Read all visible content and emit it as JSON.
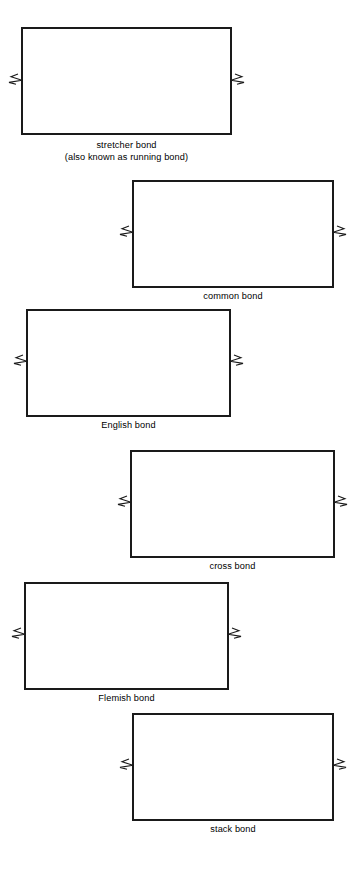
{
  "page": {
    "background_color": "#ffffff",
    "line_color": "#1a1a1a",
    "brick_fill": "#ffffff",
    "width": 357,
    "height": 869
  },
  "figures": [
    {
      "id": "stretcher-bond",
      "caption_lines": [
        "stretcher bond",
        "(also known as running bond)"
      ],
      "caption_text": "stretcher bond (also known as running bond)",
      "align": "left",
      "wall": {
        "x": 22,
        "y": 28,
        "width": 209,
        "height": 106
      },
      "caption": {
        "y": 139
      },
      "courses": 7,
      "course_height": 15.14,
      "pattern": "running",
      "break_symbols": [
        "left",
        "right"
      ],
      "break_y": 79,
      "rows": [
        {
          "type": "stretcher",
          "offset": 0.0
        },
        {
          "type": "stretcher",
          "offset": 0.5
        },
        {
          "type": "stretcher",
          "offset": 0.0
        },
        {
          "type": "stretcher",
          "offset": 0.5
        },
        {
          "type": "stretcher",
          "offset": 0.0
        },
        {
          "type": "stretcher",
          "offset": 0.5
        },
        {
          "type": "stretcher",
          "offset": 0.0
        }
      ],
      "unit_width": 37.0
    },
    {
      "id": "common-bond",
      "caption_lines": [
        "common bond"
      ],
      "caption_text": "common bond",
      "align": "right",
      "wall": {
        "x": 133,
        "y": 181,
        "width": 200,
        "height": 106
      },
      "caption": {
        "y": 290
      },
      "courses": 7,
      "course_height": 15.14,
      "pattern": "common",
      "break_symbols": [
        "left",
        "right"
      ],
      "break_y": 231,
      "rows": [
        {
          "type": "header",
          "offset": 0.0
        },
        {
          "type": "stretcher",
          "offset": 0.25
        },
        {
          "type": "stretcher",
          "offset": 0.0
        },
        {
          "type": "stretcher",
          "offset": 0.5
        },
        {
          "type": "stretcher",
          "offset": 0.0
        },
        {
          "type": "stretcher",
          "offset": 0.5
        },
        {
          "type": "header",
          "offset": 0.0
        }
      ],
      "unit_width": 35.5,
      "header_width": 15.2
    },
    {
      "id": "english-bond",
      "caption_lines": [
        "English bond"
      ],
      "caption_text": "English bond",
      "align": "left",
      "wall": {
        "x": 27,
        "y": 310,
        "width": 203,
        "height": 106
      },
      "caption": {
        "y": 419
      },
      "courses": 7,
      "course_height": 15.14,
      "pattern": "english",
      "break_symbols": [
        "left",
        "right"
      ],
      "break_y": 360,
      "rows": [
        {
          "type": "stretcher",
          "offset": 0.0
        },
        {
          "type": "header",
          "offset": 0.25
        },
        {
          "type": "stretcher",
          "offset": 0.5
        },
        {
          "type": "header",
          "offset": 0.75
        },
        {
          "type": "stretcher",
          "offset": 0.0
        },
        {
          "type": "header",
          "offset": 0.25
        },
        {
          "type": "stretcher",
          "offset": 0.5
        }
      ],
      "unit_width": 37.2,
      "header_width": 18.6
    },
    {
      "id": "cross-bond",
      "caption_lines": [
        "cross bond"
      ],
      "caption_text": "cross bond",
      "align": "right",
      "wall": {
        "x": 131,
        "y": 451,
        "width": 203,
        "height": 106
      },
      "caption": {
        "y": 560
      },
      "courses": 7,
      "course_height": 15.14,
      "pattern": "cross",
      "break_symbols": [
        "left",
        "right"
      ],
      "break_y": 501,
      "rows": [
        {
          "type": "stretcher",
          "offset": 0.0
        },
        {
          "type": "header",
          "offset": 0.5
        },
        {
          "type": "stretcher",
          "offset": 0.25
        },
        {
          "type": "header",
          "offset": 0.0
        },
        {
          "type": "stretcher",
          "offset": 0.5
        },
        {
          "type": "header",
          "offset": 0.25
        },
        {
          "type": "stretcher",
          "offset": 0.0
        }
      ],
      "unit_width": 37.2,
      "header_width": 18.6
    },
    {
      "id": "flemish-bond",
      "caption_lines": [
        "Flemish bond"
      ],
      "caption_text": "Flemish bond",
      "align": "left",
      "wall": {
        "x": 25,
        "y": 583,
        "width": 203,
        "height": 106
      },
      "caption": {
        "y": 692
      },
      "courses": 7,
      "course_height": 15.14,
      "pattern": "flemish",
      "break_symbols": [
        "left",
        "right"
      ],
      "break_y": 633,
      "rows": [
        {
          "type": "flemish",
          "offset": 0.0
        },
        {
          "type": "flemish",
          "offset": 0.5
        },
        {
          "type": "flemish",
          "offset": 0.0
        },
        {
          "type": "flemish",
          "offset": 0.5
        },
        {
          "type": "flemish",
          "offset": 0.0
        },
        {
          "type": "flemish",
          "offset": 0.5
        },
        {
          "type": "flemish",
          "offset": 0.0
        }
      ],
      "unit_width": 55.0,
      "header_width": 18.3
    },
    {
      "id": "stack-bond",
      "caption_lines": [
        "stack bond"
      ],
      "caption_text": "stack bond",
      "align": "right",
      "wall": {
        "x": 133,
        "y": 714,
        "width": 200,
        "height": 106
      },
      "caption": {
        "y": 823
      },
      "courses": 7,
      "course_height": 15.14,
      "pattern": "stack",
      "break_symbols": [
        "left",
        "right"
      ],
      "break_y": 764,
      "rows": [
        {
          "type": "stretcher",
          "offset": 0.0
        },
        {
          "type": "stretcher",
          "offset": 0.0
        },
        {
          "type": "stretcher",
          "offset": 0.0
        },
        {
          "type": "stretcher",
          "offset": 0.0
        },
        {
          "type": "stretcher",
          "offset": 0.0
        },
        {
          "type": "stretcher",
          "offset": 0.0
        },
        {
          "type": "stretcher",
          "offset": 0.0
        }
      ],
      "unit_width": 33.4
    }
  ]
}
